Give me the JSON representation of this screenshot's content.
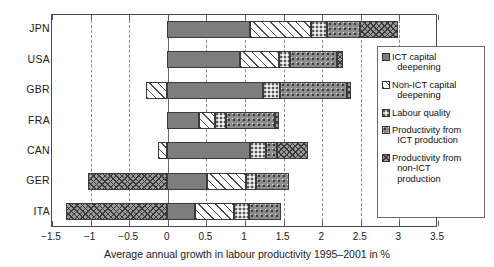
{
  "chart_data": {
    "type": "bar",
    "orientation": "horizontal",
    "stacked": true,
    "title": "",
    "xlabel": "Average annual growth in labour productivity 1995–2001 in %",
    "ylabel": "",
    "xlim": [
      -1.5,
      3.5
    ],
    "xticks": [
      -1.5,
      -1,
      -0.5,
      0,
      0.5,
      1,
      1.5,
      2,
      2.5,
      3,
      3.5
    ],
    "xtick_labels": [
      "-1.5",
      "-1",
      "-0.5",
      "0",
      "0.5",
      "1",
      "1.5",
      "2",
      "2.5",
      "3",
      "3.5"
    ],
    "grid": true,
    "grid_style": "dashed-vertical",
    "legend_position": "right-inside",
    "categories": [
      "JPN",
      "USA",
      "GBR",
      "FRA",
      "CAN",
      "GER",
      "ITA"
    ],
    "series": [
      {
        "name": "ICT capital deepening",
        "pattern": "ict",
        "values": [
          1.08,
          0.95,
          1.25,
          0.42,
          1.08,
          0.52,
          0.36
        ]
      },
      {
        "name": "Non-ICT capital deepening",
        "pattern": "nonict",
        "values": [
          0.79,
          0.5,
          -0.27,
          0.21,
          -0.12,
          0.5,
          0.51
        ]
      },
      {
        "name": "Labour quality",
        "pattern": "labour",
        "values": [
          0.21,
          0.15,
          0.22,
          0.14,
          0.2,
          0.13,
          0.2
        ]
      },
      {
        "name": "Productivity from ICT production",
        "pattern": "prodict",
        "values": [
          0.42,
          0.6,
          0.87,
          0.63,
          0.15,
          0.43,
          0.41
        ]
      },
      {
        "name": "Productivity from non-ICT production",
        "pattern": "prodnonict",
        "values": [
          0.5,
          0.08,
          0.05,
          0.05,
          0.4,
          -1.02,
          -1.3
        ]
      }
    ],
    "totals": [
      3.0,
      2.28,
      2.12,
      1.45,
      1.71,
      0.56,
      0.18
    ]
  },
  "axis": {
    "x_title": "Average annual growth in labour productivity 1995–2001 in %",
    "tick_labels": [
      "-1.5",
      "-1",
      "-0.5",
      "0",
      "0.5",
      "1",
      "1.5",
      "2",
      "2.5",
      "3",
      "3.5"
    ],
    "category_labels": [
      "JPN",
      "USA",
      "GBR",
      "FRA",
      "CAN",
      "GER",
      "ITA"
    ]
  },
  "legend": {
    "items": [
      {
        "label_line1": "ICT capital",
        "label_line2": "deepening",
        "key": "ict"
      },
      {
        "label_line1": "Non-ICT capital",
        "label_line2": "deepening",
        "key": "nonict"
      },
      {
        "label_line1": "Labour quality",
        "label_line2": "",
        "key": "labour"
      },
      {
        "label_line1": "Productivity from",
        "label_line2": "ICT production",
        "key": "prodict"
      },
      {
        "label_line1": "Productivity from",
        "label_line2": "non-ICT",
        "label_line3": "production",
        "key": "prodnonict"
      }
    ]
  },
  "colors": {
    "ict": "#7d7d7d",
    "nonict": "#ffffff",
    "labour": "#c9c9c9",
    "prodict": "#8d8d8d",
    "prodnonict": "#9a9a9a",
    "axis": "#4a4a4a",
    "grid": "#8a8a8a",
    "text": "#1a1a1a",
    "background": "#ffffff"
  }
}
